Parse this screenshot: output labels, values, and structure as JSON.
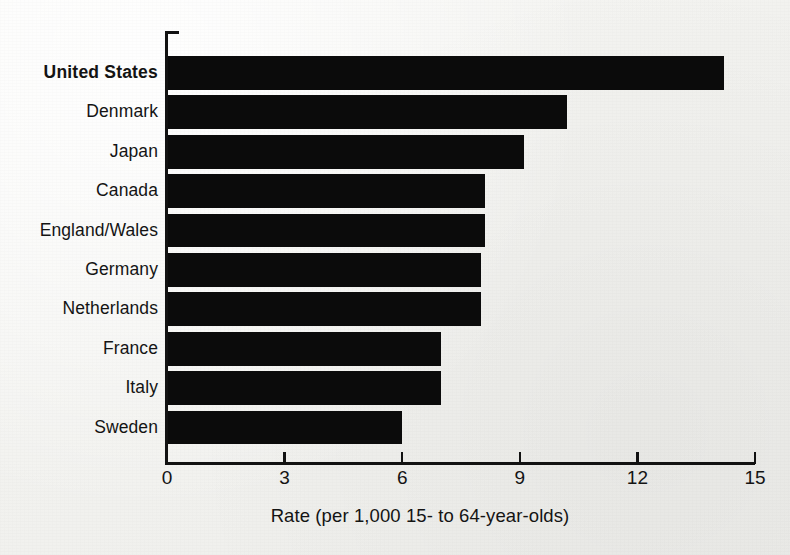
{
  "chart_data": {
    "type": "bar",
    "orientation": "horizontal",
    "title": "",
    "xlabel": "Rate (per 1,000 15- to 64-year-olds)",
    "ylabel": "",
    "xlim": [
      0,
      15
    ],
    "xticks": [
      "0",
      "3",
      "6",
      "9",
      "12",
      "15"
    ],
    "xtick_values": [
      0,
      3,
      6,
      9,
      12,
      15
    ],
    "grid": false,
    "legend": null,
    "bar_color": "#0b0b0b",
    "background_color": "#f3f3f1",
    "categories": [
      "United States",
      "Denmark",
      "Japan",
      "Canada",
      "England/Wales",
      "Germany",
      "Netherlands",
      "France",
      "Italy",
      "Sweden"
    ],
    "values": [
      14.2,
      10.2,
      9.1,
      8.1,
      8.1,
      8.0,
      8.0,
      7.0,
      7.0,
      6.0
    ],
    "emphasized_category": "United States"
  }
}
